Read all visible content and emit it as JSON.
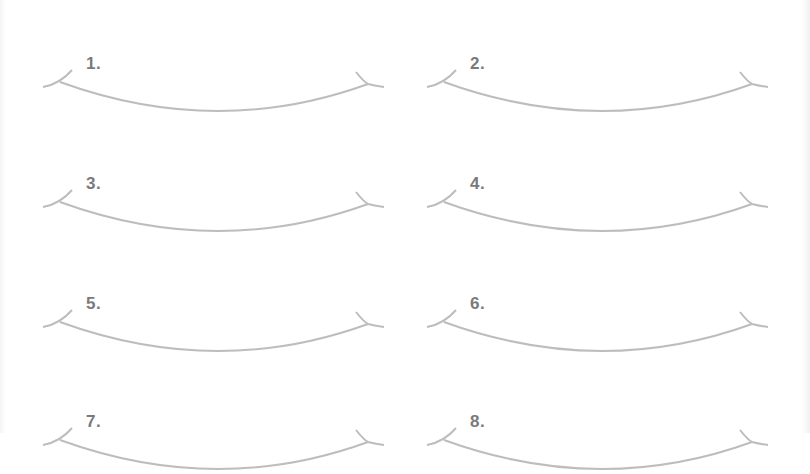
{
  "worksheet": {
    "items": [
      {
        "label": "1."
      },
      {
        "label": "2."
      },
      {
        "label": "3."
      },
      {
        "label": "4."
      },
      {
        "label": "5."
      },
      {
        "label": "6."
      },
      {
        "label": "7."
      },
      {
        "label": "8."
      }
    ],
    "colors": {
      "line": "#bdbdbd",
      "label": "#7a7a7a",
      "background": "#ffffff"
    }
  }
}
